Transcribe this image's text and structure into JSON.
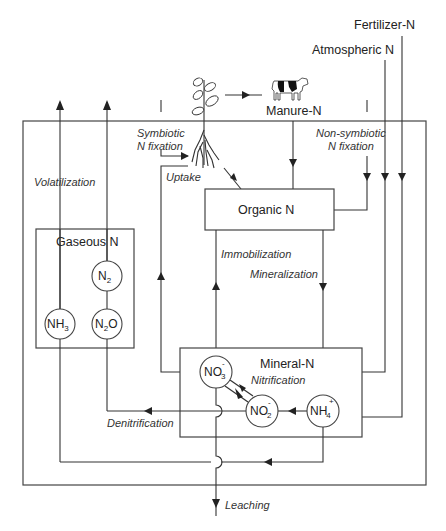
{
  "diagram": {
    "sources": {
      "fertilizer": "Fertilizer-N",
      "atmospheric": "Atmospheric N",
      "manure": "Manure-N"
    },
    "pools": {
      "organic": "Organic N",
      "gaseous": "Gaseous N",
      "mineral": "Mineral-N"
    },
    "species": {
      "n2": {
        "base": "N",
        "sub": "2",
        "sup": ""
      },
      "n2o": {
        "base": "N",
        "sub": "2",
        "tail": "O"
      },
      "nh3": {
        "base": "NH",
        "sub": "3"
      },
      "no3": {
        "base": "NO",
        "sub": "3",
        "sup": "-"
      },
      "no2": {
        "base": "NO",
        "sub": "2",
        "sup": "-"
      },
      "nh4": {
        "base": "NH",
        "sub": "4",
        "sup": "+"
      }
    },
    "processes": {
      "symbiotic_1": "Symbiotic",
      "symbiotic_2": "N fixation",
      "nonsymbiotic_1": "Non-symbiotic",
      "nonsymbiotic_2": "N fixation",
      "uptake": "Uptake",
      "volatilization": "Volatilization",
      "immobilization": "Immobilization",
      "mineralization": "Mineralization",
      "nitrification": "Nitrification",
      "denitrification": "Denitrification",
      "leaching": "Leaching"
    },
    "icons": {
      "plant": "plant-icon",
      "cow": "cow-icon"
    }
  }
}
